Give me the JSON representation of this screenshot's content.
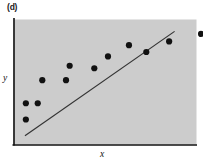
{
  "figure": {
    "panel_label": "(d)",
    "x_axis_label": "x",
    "y_axis_label": "y"
  },
  "style": {
    "panel_fill": "#cccccc",
    "axis_color": "#111111",
    "point_color": "#111111",
    "line_color": "#333333",
    "background": "#ffffff"
  },
  "chart_data": {
    "type": "scatter",
    "title": "(d)",
    "xlabel": "x",
    "ylabel": "y",
    "grid": false,
    "legend": false,
    "axis_style": "left-and-bottom-spines-only",
    "tick_labels": {
      "x": [],
      "y": []
    },
    "xlim": [
      0,
      100
    ],
    "ylim": [
      0,
      100
    ],
    "point_radius_px": 3.1,
    "points": [
      {
        "x": 6.5,
        "y": 20.0
      },
      {
        "x": 6.5,
        "y": 33.0
      },
      {
        "x": 13.0,
        "y": 33.0
      },
      {
        "x": 15.5,
        "y": 51.5
      },
      {
        "x": 28.5,
        "y": 51.5
      },
      {
        "x": 30.5,
        "y": 63.0
      },
      {
        "x": 44.0,
        "y": 61.0
      },
      {
        "x": 51.5,
        "y": 70.5
      },
      {
        "x": 63.0,
        "y": 79.5
      },
      {
        "x": 72.5,
        "y": 74.0
      },
      {
        "x": 85.0,
        "y": 82.5
      },
      {
        "x": 102.5,
        "y": 88.5
      },
      {
        "x": 110.0,
        "y": 80.5
      }
    ],
    "trend_line": {
      "type": "straight-fit-line",
      "x_start": 6.0,
      "y_start": 7.0,
      "x_end": 88.0,
      "y_end": 90.5
    }
  }
}
